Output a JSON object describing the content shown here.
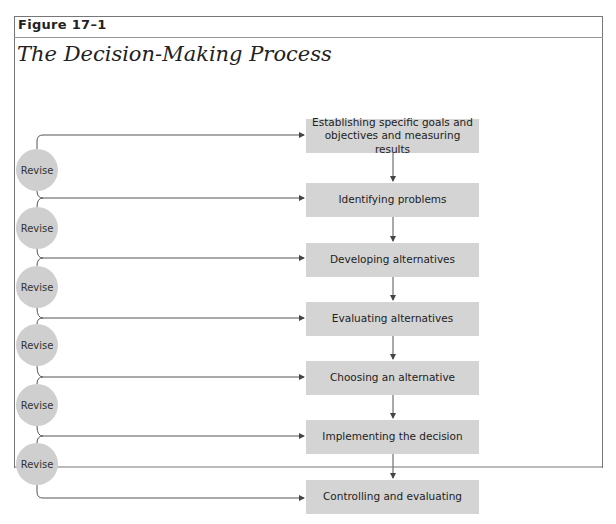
{
  "figure": {
    "label": "Figure 17–1",
    "title": "The Decision-Making Process"
  },
  "steps": [
    {
      "label": "Establishing specific goals and objectives and measuring results"
    },
    {
      "label": "Identifying problems"
    },
    {
      "label": "Developing alternatives"
    },
    {
      "label": "Evaluating alternatives"
    },
    {
      "label": "Choosing an alternative"
    },
    {
      "label": "Implementing the decision"
    },
    {
      "label": "Controlling and evaluating"
    }
  ],
  "revise_nodes": [
    {
      "label": "Revise"
    },
    {
      "label": "Revise"
    },
    {
      "label": "Revise"
    },
    {
      "label": "Revise"
    },
    {
      "label": "Revise"
    },
    {
      "label": "Revise"
    }
  ],
  "colors": {
    "box_fill": "#d4d4d4",
    "circle_fill": "#cfcfcf",
    "line": "#555555"
  }
}
